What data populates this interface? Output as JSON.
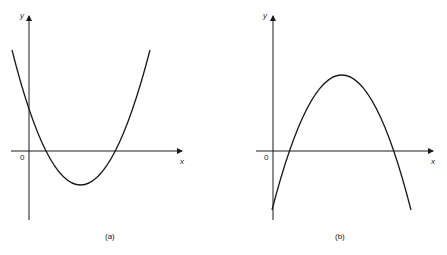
{
  "figures": [
    {
      "id": "a",
      "caption": "(a)",
      "x_label": "x",
      "y_label": "y",
      "origin_label": "0",
      "curve": "upward parabola"
    },
    {
      "id": "b",
      "caption": "(b)",
      "x_label": "x",
      "y_label": "y",
      "origin_label": "0",
      "curve": "downward parabola"
    }
  ],
  "colors": {
    "line": "#1a1a1a",
    "background": "#ffffff"
  }
}
